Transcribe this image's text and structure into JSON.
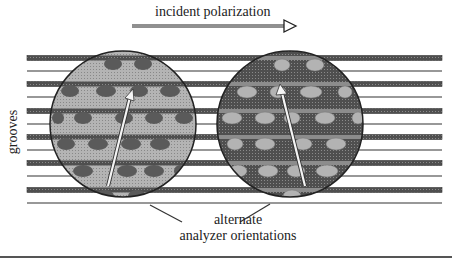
{
  "figure": {
    "title_arrow_label": "incident polarization",
    "side_label": "grooves",
    "bottom_label_line1": "alternate",
    "bottom_label_line2": "analyzer orientations"
  },
  "colors": {
    "thick_groove": "#4a4a4a",
    "thin_groove": "#333333",
    "circle_left_fill": "#a8a8a8",
    "circle_left_dots": "#555555",
    "circle_right_fill": "#5e5e5e",
    "circle_right_dots": "#b0b0b0",
    "arrow": "#f4f4f4"
  },
  "grooves": {
    "thick_y": [
      58,
      84,
      111,
      137,
      163,
      190
    ],
    "thin_y": [
      71,
      97,
      124,
      150,
      176,
      203
    ],
    "x_start": 27,
    "x_end": 442
  },
  "circles": [
    {
      "name": "left-analyzer",
      "cx": 123,
      "cy": 124,
      "r": 73,
      "arrow": {
        "x1": 108,
        "y1": 186,
        "x2": 131,
        "y2": 93
      }
    },
    {
      "name": "right-analyzer",
      "cx": 290,
      "cy": 124,
      "r": 73,
      "arrow": {
        "x1": 305,
        "y1": 186,
        "x2": 281,
        "y2": 88
      }
    }
  ]
}
